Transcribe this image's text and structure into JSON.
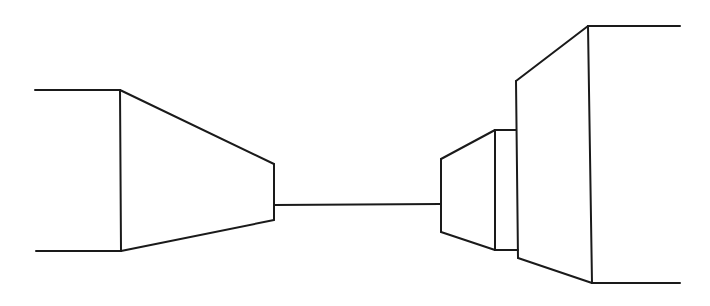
{
  "drawing": {
    "type": "perspective line sketch",
    "stroke_color": "#1a1a1a",
    "background_color": "#ffffff",
    "stroke_width": 2,
    "shapes": {
      "left_block": {
        "top_edge": [
          [
            35,
            90
          ],
          [
            120,
            90
          ]
        ],
        "bottom_edge": [
          [
            36,
            251
          ],
          [
            121,
            251
          ]
        ],
        "front_vertical": [
          [
            120,
            90
          ],
          [
            121,
            251
          ]
        ],
        "top_diagonal": [
          [
            120,
            90
          ],
          [
            274,
            164
          ]
        ],
        "bottom_diagonal": [
          [
            121,
            251
          ],
          [
            274,
            220
          ]
        ],
        "back_vertical": [
          [
            274,
            164
          ],
          [
            274,
            220
          ]
        ]
      },
      "connector": {
        "line": [
          [
            274,
            205
          ],
          [
            441,
            204
          ]
        ]
      },
      "middle_right_block": {
        "front_vertical": [
          [
            441,
            159
          ],
          [
            441,
            232
          ]
        ],
        "top_diagonal": [
          [
            441,
            159
          ],
          [
            495,
            130
          ]
        ],
        "bottom_diagonal": [
          [
            441,
            232
          ],
          [
            495,
            250
          ]
        ],
        "back_vertical": [
          [
            495,
            130
          ],
          [
            495,
            250
          ]
        ],
        "top_edge": [
          [
            495,
            130
          ],
          [
            516,
            130
          ]
        ],
        "bottom_edge": [
          [
            495,
            250
          ],
          [
            518,
            250
          ]
        ]
      },
      "right_block": {
        "front_vertical": [
          [
            516,
            81
          ],
          [
            518,
            258
          ]
        ],
        "top_diagonal": [
          [
            516,
            81
          ],
          [
            588,
            26
          ]
        ],
        "bottom_diagonal": [
          [
            518,
            258
          ],
          [
            592,
            283
          ]
        ],
        "back_vertical": [
          [
            588,
            26
          ],
          [
            592,
            283
          ]
        ],
        "top_edge": [
          [
            588,
            26
          ],
          [
            680,
            26
          ]
        ],
        "bottom_edge": [
          [
            592,
            283
          ],
          [
            680,
            283
          ]
        ]
      }
    }
  }
}
